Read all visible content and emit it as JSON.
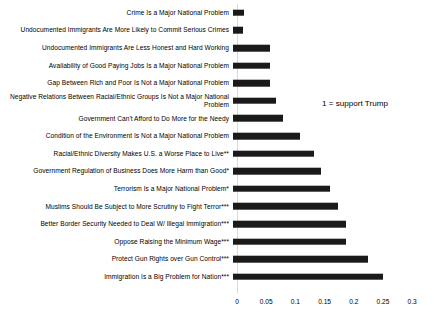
{
  "chart_data": {
    "type": "bar",
    "orientation": "horizontal",
    "title": "",
    "subtitle": "",
    "xlabel": "",
    "ylabel": "",
    "xlim": [
      0,
      0.3
    ],
    "xticks": [
      "0",
      "0.05",
      "0.1",
      "0.15",
      "0.2",
      "0.25",
      "0.3"
    ],
    "xtick_values": [
      0,
      0.05,
      0.1,
      0.15,
      0.2,
      0.25,
      0.3
    ],
    "grid": false,
    "legend": "none",
    "bar_color": "#1a1a1a",
    "annotations": [
      "1 = support Trump"
    ],
    "categories": [
      "Crime Is a Major National Problem",
      "Undocumented Immigrants Are More Likely to Commit Serious Crimes",
      "Undocumented Immigrants Are Less Honest and Hard Working",
      "Availability of Good Paying Jobs Is a Major National Problem",
      "Gap Between Rich and Poor Is Not a Major National Problem",
      "Negative Relations Between Racial/Ethnic Groups Is Not a Major National Problem",
      "Government Can't Afford to Do More for the Needy",
      "Condition of the Environment Is Not a Major National Problem",
      "Racial/Ethnic Diversity Makes U.S. a Worse Place to Live**",
      "Government Regulation of Business Does More Harm than Good*",
      "Terrorism Is a Major National Problem*",
      "Muslims Should Be Subject to More Scrutiny to Fight Terror***",
      "Better Border Security Needed to Deal W/ Illegal Immigration***",
      "Oppose Raising the Minimum Wage***",
      "Protect Gun Rights over Gun Control***",
      "Immigration Is a Big Problem for Nation***"
    ],
    "values": [
      0.019,
      0.017,
      0.063,
      0.063,
      0.063,
      0.074,
      0.085,
      0.115,
      0.138,
      0.15,
      0.166,
      0.18,
      0.193,
      0.193,
      0.232,
      0.256
    ]
  },
  "annotation": {
    "text": "1 = support Trump"
  }
}
